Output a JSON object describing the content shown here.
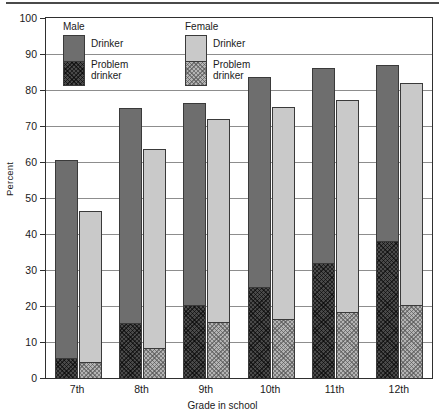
{
  "chart_data": {
    "type": "bar",
    "title": "",
    "subtitle": "",
    "xlabel": "Grade in school",
    "ylabel": "Percent",
    "categories": [
      "7th",
      "8th",
      "9th",
      "10th",
      "11th",
      "12th"
    ],
    "ylim": [
      0,
      100
    ],
    "yticks": [
      0,
      10,
      20,
      30,
      40,
      50,
      60,
      70,
      80,
      90,
      100
    ],
    "grid": true,
    "legend_position": "inside-top-left",
    "stacking": "overlay (problem drinker is a subset of drinker)",
    "series": [
      {
        "name": "Male Drinker",
        "values": [
          60.5,
          75.0,
          76.5,
          83.5,
          86.0,
          87.0
        ]
      },
      {
        "name": "Male Problem drinker",
        "values": [
          5.5,
          15.3,
          20.3,
          25.3,
          32.0,
          38.0
        ]
      },
      {
        "name": "Female Drinker",
        "values": [
          46.5,
          63.5,
          72.0,
          75.2,
          77.3,
          82.0
        ]
      },
      {
        "name": "Female Problem drinker",
        "values": [
          4.4,
          8.4,
          15.5,
          16.4,
          18.4,
          20.2
        ]
      }
    ],
    "colors": {
      "male_drinker": "#6e6e6e",
      "male_problem_drinker": "#4a4a4a",
      "female_drinker": "#c9c9c9",
      "female_problem_drinker": "#b4b4b4",
      "gridline": "#8d8d8d",
      "axis": "#2f2f2f",
      "background": "#ffffff"
    }
  },
  "legend": {
    "groups": [
      {
        "header": "Male",
        "drinker_label": "Drinker",
        "problem_label_line1": "Problem",
        "problem_label_line2": "drinker"
      },
      {
        "header": "Female",
        "drinker_label": "Drinker",
        "problem_label_line1": "Problem",
        "problem_label_line2": "drinker"
      }
    ]
  }
}
